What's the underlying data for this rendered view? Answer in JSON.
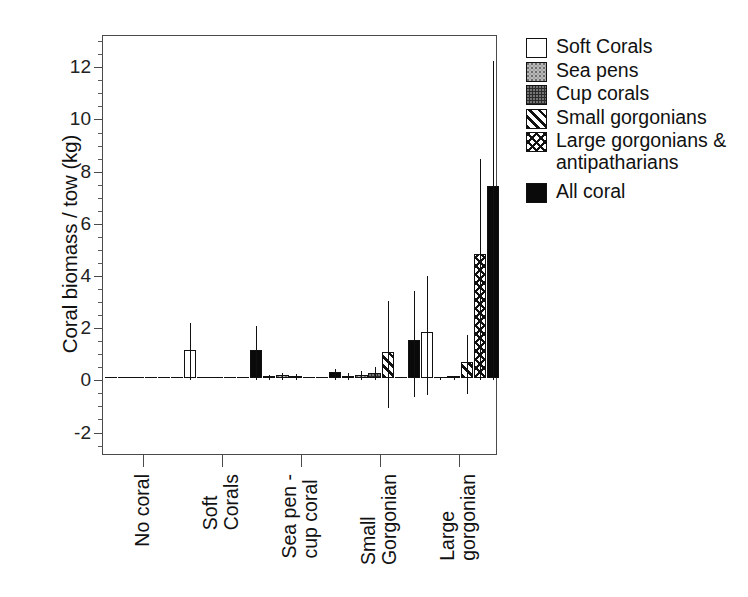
{
  "chart_data": {
    "type": "bar",
    "title": "",
    "subtitle": "",
    "xlabel": "",
    "ylabel": "Coral biomass / tow (kg)",
    "ylim": [
      -2.9,
      13.2
    ],
    "yticks": [
      -2,
      0,
      2,
      4,
      6,
      8,
      10,
      12
    ],
    "ytick_labels": [
      "-2",
      "0",
      "2",
      "4",
      "6",
      "8",
      "10",
      "12"
    ],
    "yminor_step": 0.5,
    "grid": false,
    "legend_position": "right",
    "categories": [
      "No coral",
      "Soft Corals",
      "Sea pen - cup coral",
      "Small Gorgonian",
      "Large gorgonian"
    ],
    "category_lines": [
      [
        "No coral"
      ],
      [
        "Soft",
        "Corals"
      ],
      [
        "Sea pen -",
        "cup coral"
      ],
      [
        "Small",
        "Gorgonian"
      ],
      [
        "Large",
        "gorgonian"
      ]
    ],
    "series": [
      {
        "name": "Soft Corals",
        "fill": "soft",
        "values": [
          0.0,
          1.1,
          0.06,
          0.1,
          1.78
        ],
        "err_upper": [
          0.0,
          2.2,
          0.22,
          0.3,
          4.0
        ],
        "err_lower": [
          0.0,
          0.0,
          0.0,
          0.0,
          -0.55
        ]
      },
      {
        "name": "Sea pens",
        "fill": "seapen",
        "values": [
          0.0,
          0.0,
          0.12,
          0.13,
          0.03
        ],
        "err_upper": [
          0.0,
          0.0,
          0.3,
          0.36,
          0.1
        ],
        "err_lower": [
          0.0,
          0.0,
          0.0,
          0.0,
          0.0
        ]
      },
      {
        "name": "Cup corals",
        "fill": "cup",
        "values": [
          0.0,
          0.0,
          0.1,
          0.22,
          0.06
        ],
        "err_upper": [
          0.0,
          0.0,
          0.26,
          0.5,
          0.16
        ],
        "err_lower": [
          0.0,
          0.0,
          0.0,
          0.0,
          0.0
        ]
      },
      {
        "name": "Small gorgonians",
        "fill": "smallgorg",
        "values": [
          0.0,
          0.0,
          0.0,
          1.0,
          0.62
        ],
        "err_upper": [
          0.0,
          0.0,
          0.0,
          3.05,
          1.72
        ],
        "err_lower": [
          0.0,
          0.0,
          0.0,
          -1.05,
          -0.52
        ]
      },
      {
        "name": "Large gorgonians & antipatharians",
        "fill": "largegorg",
        "values": [
          0.0,
          0.0,
          0.0,
          0.0,
          4.78
        ],
        "err_upper": [
          0.0,
          0.0,
          0.0,
          0.0,
          8.5
        ],
        "err_lower": [
          0.0,
          0.0,
          0.0,
          0.0,
          0.0
        ]
      },
      {
        "name": "All coral",
        "fill": "all",
        "values": [
          0.0,
          1.1,
          0.26,
          1.48,
          7.38
        ],
        "err_upper": [
          0.0,
          2.1,
          0.42,
          3.42,
          12.25
        ],
        "err_lower": [
          0.0,
          0.0,
          0.0,
          -0.62,
          0.0
        ]
      }
    ]
  },
  "legend": {
    "items": [
      {
        "label": "Soft Corals",
        "swatch": "white-square-icon"
      },
      {
        "label": "Sea pens",
        "swatch": "light-stipple-square-icon"
      },
      {
        "label": "Cup corals",
        "swatch": "dark-stipple-square-icon"
      },
      {
        "label": "Small gorgonians",
        "swatch": "diagonal-hatch-square-icon"
      },
      {
        "label": "Large gorgonians &\nantipatharians",
        "swatch": "cross-hatch-square-icon"
      },
      {
        "label": "All coral",
        "swatch": "black-square-icon"
      }
    ]
  }
}
